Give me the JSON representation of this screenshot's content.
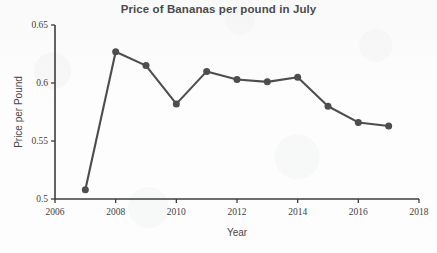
{
  "chart_data": {
    "type": "line",
    "title": "Price of Bananas per pound in July",
    "xlabel": "Year",
    "ylabel": "Price per Pound",
    "x": [
      2007,
      2008,
      2009,
      2010,
      2011,
      2012,
      2013,
      2014,
      2015,
      2016,
      2017
    ],
    "values": [
      0.508,
      0.627,
      0.615,
      0.582,
      0.61,
      0.603,
      0.601,
      0.605,
      0.58,
      0.566,
      0.563
    ],
    "series": [
      {
        "name": "Price per Pound",
        "values": [
          0.508,
          0.627,
          0.615,
          0.582,
          0.61,
          0.603,
          0.601,
          0.605,
          0.58,
          0.566,
          0.563
        ]
      }
    ],
    "xlim": [
      2006,
      2018
    ],
    "ylim": [
      0.5,
      0.65
    ],
    "xticks": [
      2006,
      2008,
      2010,
      2012,
      2014,
      2016,
      2018
    ],
    "xtick_labels": [
      "2006",
      "2008",
      "2010",
      "2012",
      "2014",
      "2016",
      "2018"
    ],
    "yticks": [
      0.5,
      0.55,
      0.6,
      0.65
    ],
    "ytick_labels": [
      "0.5",
      "0.55",
      "0.6",
      "0.65"
    ],
    "grid": false,
    "legend": false,
    "marker": "circle",
    "line_color": "#4d4d4d",
    "marker_color": "#4d4d4d",
    "background_color": "#fdfdfd"
  }
}
